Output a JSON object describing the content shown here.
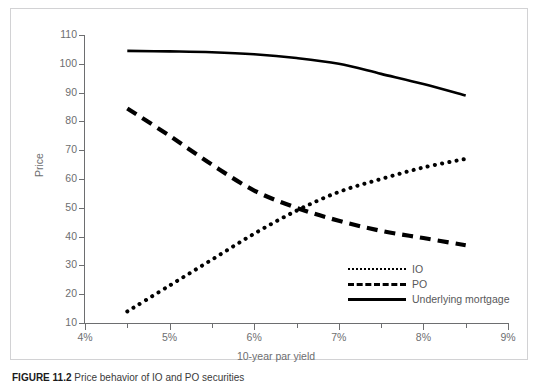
{
  "figure": {
    "caption_number": "FIGURE 11.2",
    "caption_text": "Price behavior of IO and PO securities"
  },
  "axes": {
    "y_title": "Price",
    "x_title": "10-year par yield",
    "y_ticks": [
      "110",
      "100",
      "90",
      "80",
      "70",
      "60",
      "50",
      "40",
      "30",
      "20",
      "10"
    ],
    "x_ticks": [
      "4%",
      "5%",
      "6%",
      "7%",
      "8%",
      "9%"
    ]
  },
  "legend": {
    "position": "bottom-right",
    "items": [
      {
        "label": "IO",
        "style": "dotted",
        "icon": "dotted-line-icon"
      },
      {
        "label": "PO",
        "style": "dashed",
        "icon": "dashed-line-icon"
      },
      {
        "label": "Underlying mortgage",
        "style": "solid",
        "icon": "solid-line-icon"
      }
    ]
  },
  "colors": {
    "series_line": "#000000",
    "axis": "#6d6e70",
    "text": "#58585a",
    "frame": "#d2d2d4",
    "background": "#ffffff"
  },
  "chart_data": {
    "type": "line",
    "title": "",
    "xlabel": "10-year par yield",
    "ylabel": "Price",
    "xlim": [
      4,
      9
    ],
    "ylim": [
      10,
      110
    ],
    "xtick_values": [
      4,
      5,
      6,
      7,
      8,
      9
    ],
    "xtick_labels": [
      "4%",
      "5%",
      "6%",
      "7%",
      "8%",
      "9%"
    ],
    "xminor_values": [
      4.5,
      5.5,
      6.5,
      7.5,
      8.5
    ],
    "ytick_values": [
      10,
      20,
      30,
      40,
      50,
      60,
      70,
      80,
      90,
      100,
      110
    ],
    "grid": false,
    "legend_position": "lower right",
    "x": [
      4.5,
      5.0,
      5.5,
      6.0,
      6.5,
      7.0,
      7.5,
      8.0,
      8.5
    ],
    "series": [
      {
        "name": "IO",
        "style": "dotted",
        "values": [
          14,
          23,
          32,
          41,
          49,
          55.5,
          60,
          64,
          67
        ]
      },
      {
        "name": "PO",
        "style": "dashed",
        "values": [
          84.5,
          75,
          65,
          56,
          50,
          45.5,
          42,
          39.5,
          37
        ]
      },
      {
        "name": "Underlying mortgage",
        "style": "solid",
        "values": [
          104.5,
          104.3,
          104,
          103.3,
          102,
          100,
          96.5,
          93,
          89
        ]
      }
    ]
  }
}
